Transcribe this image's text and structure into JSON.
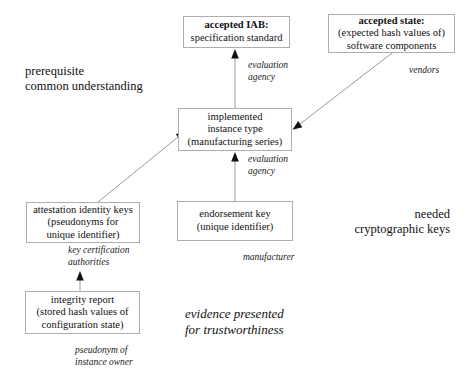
{
  "diagram": {
    "title_note_left": {
      "line1": "prerequisite",
      "line2": "common understanding"
    },
    "title_note_right": {
      "line1": "needed",
      "line2": "cryptographic keys"
    },
    "title_note_evidence": {
      "line1": "evidence presented",
      "line2": "for trustworthiness"
    }
  },
  "boxes": {
    "accepted_iab": {
      "line1": "accepted IAB:",
      "line2": "specification standard"
    },
    "accepted_state": {
      "line1": "accepted state:",
      "line2": "(expected hash values of)",
      "line3": "software components"
    },
    "instance_type": {
      "line1": "implemented",
      "line2": "instance type",
      "line3": "(manufacturing series)"
    },
    "attestation_keys": {
      "line1": "attestation identity keys",
      "line2": "(pseudonyms for",
      "line3": "unique identifier)"
    },
    "endorsement_key": {
      "line1": "endorsement key",
      "line2": "(unique identifier)"
    },
    "integrity_report": {
      "line1": "integrity report",
      "line2": "(stored hash values of",
      "line3": "configuration state)"
    }
  },
  "edge_labels": {
    "evaluation_agency_top": {
      "line1": "evaluation",
      "line2": "agency"
    },
    "evaluation_agency_mid": {
      "line1": "evaluation",
      "line2": "agency"
    },
    "vendors": {
      "line1": "vendors"
    },
    "key_certification": {
      "line1": "key certification",
      "line2": "authorities"
    },
    "manufacturer": {
      "line1": "manufacturer"
    },
    "pseudonym_owner": {
      "line1": "pseudonym of",
      "line2": "instance owner"
    }
  },
  "colors": {
    "box_border": "#aeaeae",
    "edge_line": "#9a9a9a",
    "arrow_head": "#111111",
    "text": "#111111",
    "background": "#ffffff"
  }
}
